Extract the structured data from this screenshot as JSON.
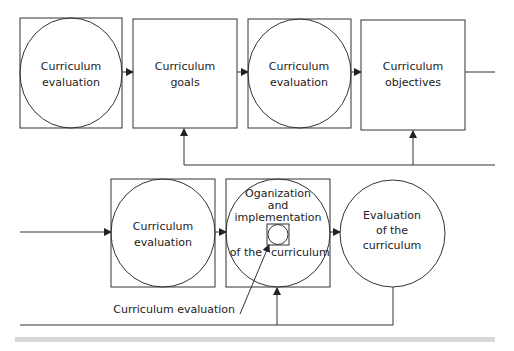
{
  "diagram": {
    "type": "flowchart",
    "top_row": {
      "nodes": [
        {
          "id": "n1",
          "shape": "circle-in-square",
          "lines": [
            "Curriculum",
            "evaluation"
          ]
        },
        {
          "id": "n2",
          "shape": "square",
          "lines": [
            "Curriculum",
            "goals"
          ]
        },
        {
          "id": "n3",
          "shape": "circle-in-square",
          "lines": [
            "Curriculum",
            "evaluation"
          ]
        },
        {
          "id": "n4",
          "shape": "square",
          "lines": [
            "Curriculum",
            "objectives"
          ]
        }
      ]
    },
    "bottom_row": {
      "nodes": [
        {
          "id": "n5",
          "shape": "circle-in-square",
          "lines": [
            "Curriculum",
            "evaluation"
          ]
        },
        {
          "id": "n6",
          "shape": "circle-in-square",
          "lines": [
            "Oganization",
            "and",
            "implementation",
            "of the",
            "curriculum"
          ]
        },
        {
          "id": "n7",
          "shape": "circle",
          "lines": [
            "Evaluation",
            "of the",
            "curriculum"
          ]
        }
      ]
    },
    "annotation": {
      "label": "Curriculum evaluation",
      "points_to": "n6-inner-box"
    },
    "edges": [
      {
        "from": "n1",
        "to": "n2"
      },
      {
        "from": "n2",
        "to": "n3"
      },
      {
        "from": "n3",
        "to": "n4"
      },
      {
        "from": "n4",
        "to": "continues-right"
      },
      {
        "from": "feedback-top",
        "to": "n2"
      },
      {
        "from": "feedback-top",
        "to": "n4"
      },
      {
        "from": "incoming-left",
        "to": "n5"
      },
      {
        "from": "n5",
        "to": "n6"
      },
      {
        "from": "n6",
        "to": "n7"
      },
      {
        "from": "n7",
        "to": "n6",
        "via": "feedback-bottom"
      }
    ],
    "colors": {
      "stroke": "#333333",
      "text": "#222222",
      "background": "#ffffff",
      "band": "#d8d8d8"
    }
  }
}
